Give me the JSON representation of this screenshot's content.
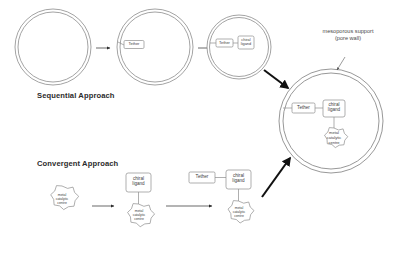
{
  "diagram": {
    "title_sequential": "Sequential Approach",
    "title_convergent": "Convergent Approach",
    "annotation_support_line1": "mesoporous support",
    "annotation_support_line2": "(pore wall)",
    "labels": {
      "tether": "Tether",
      "chiral_line1": "chiral",
      "chiral_line2": "ligand",
      "metal_line1": "metal",
      "metal_line2": "catalytic",
      "metal_line3": "centre"
    },
    "sequential": {
      "step1": {
        "contents": []
      },
      "step2": {
        "contents": [
          "Tether"
        ]
      },
      "step3": {
        "contents": [
          "Tether",
          "chiral ligand"
        ]
      }
    },
    "convergent": {
      "step1": {
        "contents": [
          "metal catalytic centre"
        ]
      },
      "step2": {
        "contents": [
          "chiral ligand",
          "metal catalytic centre"
        ]
      },
      "step3": {
        "contents": [
          "Tether",
          "chiral ligand",
          "metal catalytic centre"
        ]
      }
    },
    "product": {
      "contents": [
        "Tether",
        "chiral ligand",
        "metal catalytic centre"
      ]
    },
    "colors": {
      "stroke": "#8c8c8c",
      "text": "#3d3d3d",
      "heading": "#2b2b2b",
      "arrow_thick": "#111111",
      "background": "#ffffff"
    }
  }
}
